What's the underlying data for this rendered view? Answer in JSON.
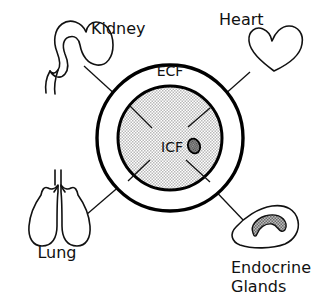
{
  "diagram": {
    "compartments": [
      {
        "id": "ecf",
        "label": "ECF",
        "fill": "#ffffff"
      },
      {
        "id": "icf",
        "label": "ICF",
        "fill": "#d8d8d8"
      }
    ],
    "nucleus": {
      "label": "",
      "fill": "#6b6b6b"
    },
    "organs": [
      {
        "id": "kidney",
        "label": "Kidney",
        "icon": "kidney-icon"
      },
      {
        "id": "heart",
        "label": "Heart",
        "icon": "heart-icon"
      },
      {
        "id": "lung",
        "label": "Lung",
        "icon": "lung-icon"
      },
      {
        "id": "endocrine",
        "label_line1": "Endocrine",
        "label_line2": "Glands",
        "icon": "adrenal-gland-icon"
      }
    ],
    "colors": {
      "ink": "#111111",
      "stipple": "#d8d8d8",
      "gland_core": "#9a9a9a",
      "background": "#ffffff"
    }
  }
}
